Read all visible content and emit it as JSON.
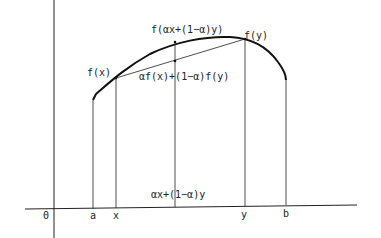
{
  "diagram": {
    "curve_labels": {
      "fx": "f(x)",
      "fy": "f(y)",
      "f_mid": "f(αx+(1−α)y)",
      "chord_mid": "αf(x)+(1−α)f(y)"
    },
    "axis_labels": {
      "origin": "0",
      "a": "a",
      "x": "x",
      "mid": "αx+(1−α)y",
      "y": "y",
      "b": "b"
    },
    "colors": {
      "ink": "#222222",
      "background": "#ffffff"
    }
  }
}
